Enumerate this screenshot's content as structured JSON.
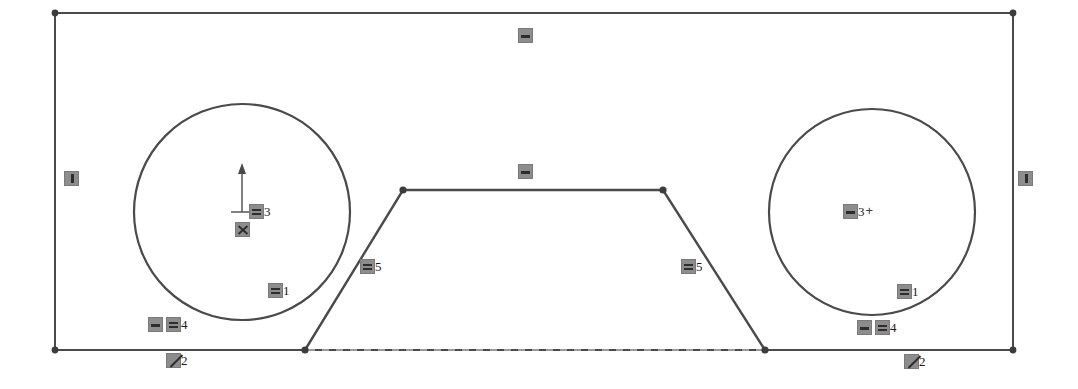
{
  "sketch": {
    "title": "Constrained sketch profile",
    "colors": {
      "geometry_stroke": "#4a4a4a",
      "construction_stroke": "#b5b5b5",
      "vertex_fill": "#3c3c3c",
      "badge_fill": "#8d8d8d",
      "badge_glyph": "#2e2e2e",
      "background": "#ffffff"
    },
    "geometry": {
      "rectangle": {
        "name": "outer-rectangle",
        "x1": 55,
        "y1": 13,
        "x2": 1013,
        "y2": 350
      },
      "circles": [
        {
          "name": "left-circle",
          "cx": 242,
          "cy": 212,
          "r": 108
        },
        {
          "name": "right-circle",
          "cx": 872,
          "cy": 212,
          "r": 103
        }
      ],
      "trapezoid": {
        "name": "center-trapezoid",
        "points": "305,350 403,190 663,190 765,350"
      },
      "construction_line": {
        "name": "bottom-construction-line",
        "x1": 305,
        "y1": 350,
        "x2": 765,
        "y2": 350
      },
      "center_marker": {
        "name": "left-circle-center-axis",
        "cx": 242,
        "cy": 212,
        "arrow_height": 45,
        "tick_half_width": 11
      },
      "vertices": [
        {
          "name": "rect-corner-top-left",
          "x": 55,
          "y": 13
        },
        {
          "name": "rect-corner-top-right",
          "x": 1013,
          "y": 13
        },
        {
          "name": "rect-corner-bottom-left",
          "x": 55,
          "y": 350
        },
        {
          "name": "rect-corner-bottom-right",
          "x": 1013,
          "y": 350
        },
        {
          "name": "trapezoid-vertex-bottom-left",
          "x": 305,
          "y": 350
        },
        {
          "name": "trapezoid-vertex-top-left",
          "x": 403,
          "y": 190
        },
        {
          "name": "trapezoid-vertex-top-right",
          "x": 663,
          "y": 190
        },
        {
          "name": "trapezoid-vertex-bottom-right",
          "x": 765,
          "y": 350
        }
      ]
    },
    "constraints": [
      {
        "name": "constraint-top-edge-horizontal",
        "icon": "horizontal-constraint-icon",
        "glyph": "horizontal",
        "label": "",
        "x": 518,
        "y": 28
      },
      {
        "name": "constraint-left-edge-vertical",
        "icon": "vertical-constraint-icon",
        "glyph": "vertical",
        "label": "",
        "x": 64,
        "y": 171
      },
      {
        "name": "constraint-right-edge-vertical",
        "icon": "vertical-constraint-icon",
        "glyph": "vertical",
        "label": "",
        "x": 1018,
        "y": 171
      },
      {
        "name": "constraint-trapezoid-top-horizontal",
        "icon": "horizontal-constraint-icon",
        "glyph": "horizontal",
        "label": "",
        "x": 518,
        "y": 164
      },
      {
        "name": "constraint-left-circle-radius-equal",
        "icon": "equal-constraint-icon",
        "glyph": "equal",
        "label": "3",
        "x": 249,
        "y": 204
      },
      {
        "name": "constraint-left-circle-concentric",
        "icon": "coincident-constraint-icon",
        "glyph": "cross",
        "label": "",
        "x": 235,
        "y": 222
      },
      {
        "name": "constraint-left-circle-tangent-bottom",
        "icon": "equal-constraint-icon",
        "glyph": "equal",
        "label": "1",
        "x": 268,
        "y": 283
      },
      {
        "name": "constraint-left-bottom-pair-equal",
        "icon": "equal-constraint-icon-pair",
        "glyph": "equal-pair",
        "label": "4",
        "x": 148,
        "y": 317
      },
      {
        "name": "constraint-left-bottom-tangent",
        "icon": "tangent-constraint-icon",
        "glyph": "diagonal",
        "label": "2",
        "x": 166,
        "y": 353
      },
      {
        "name": "constraint-left-slant-equal",
        "icon": "equal-constraint-icon",
        "glyph": "equal",
        "label": "5",
        "x": 360,
        "y": 259
      },
      {
        "name": "constraint-right-slant-equal",
        "icon": "equal-constraint-icon",
        "glyph": "equal",
        "label": "5",
        "x": 681,
        "y": 259
      },
      {
        "name": "constraint-right-circle-radius-equal",
        "icon": "equal-constraint-icon",
        "glyph": "equal-plus",
        "label": "3",
        "x": 843,
        "y": 204
      },
      {
        "name": "constraint-right-circle-tangent-bottom",
        "icon": "equal-constraint-icon",
        "glyph": "equal",
        "label": "1",
        "x": 897,
        "y": 284
      },
      {
        "name": "constraint-right-bottom-pair-equal",
        "icon": "equal-constraint-icon-pair",
        "glyph": "equal-pair",
        "label": "4",
        "x": 857,
        "y": 320
      },
      {
        "name": "constraint-right-bottom-tangent",
        "icon": "tangent-constraint-icon",
        "glyph": "diagonal",
        "label": "2",
        "x": 904,
        "y": 354
      }
    ]
  }
}
